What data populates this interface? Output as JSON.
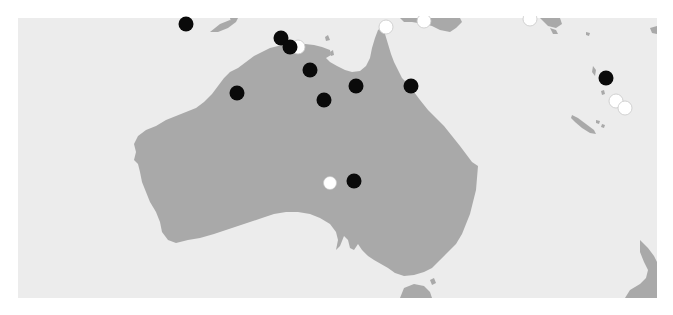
{
  "map": {
    "region": "Australia and South-West Pacific",
    "colors": {
      "background": "#ffffff",
      "ocean": "#ececec",
      "land": "#a9a9a9",
      "marker_black": "#0a0a0a",
      "marker_white": "#ffffff",
      "marker_white_stroke": "#c8c8c8"
    },
    "frame": {
      "x": 18,
      "y": 18,
      "width": 639,
      "height": 280
    },
    "markers": [
      {
        "type": "black",
        "x": 186,
        "y": 24
      },
      {
        "type": "white",
        "x": 298,
        "y": 47
      },
      {
        "type": "black",
        "x": 281,
        "y": 38
      },
      {
        "type": "black",
        "x": 290,
        "y": 47
      },
      {
        "type": "black",
        "x": 310,
        "y": 70
      },
      {
        "type": "black",
        "x": 237,
        "y": 93
      },
      {
        "type": "black",
        "x": 324,
        "y": 100
      },
      {
        "type": "black",
        "x": 356,
        "y": 86
      },
      {
        "type": "black",
        "x": 411,
        "y": 86
      },
      {
        "type": "white",
        "x": 386,
        "y": 27
      },
      {
        "type": "white",
        "x": 424,
        "y": 21
      },
      {
        "type": "white",
        "x": 530,
        "y": 19
      },
      {
        "type": "black",
        "x": 606,
        "y": 78
      },
      {
        "type": "white",
        "x": 616,
        "y": 101
      },
      {
        "type": "white",
        "x": 625,
        "y": 108
      },
      {
        "type": "white",
        "x": 330,
        "y": 183
      },
      {
        "type": "black",
        "x": 354,
        "y": 181
      }
    ]
  }
}
